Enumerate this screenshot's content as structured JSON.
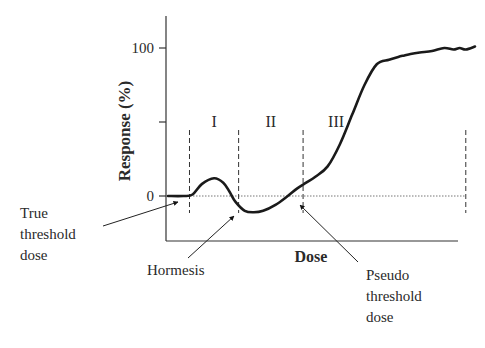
{
  "chart_data": {
    "type": "line",
    "title": "",
    "xlabel": "Dose",
    "ylabel": "Response (%)",
    "yticks": [
      {
        "value": 0,
        "label": "0"
      },
      {
        "value": 50,
        "label": ""
      },
      {
        "value": 100,
        "label": "100"
      }
    ],
    "xlim": [
      0,
      100
    ],
    "ylim": [
      -30,
      120
    ],
    "x": [
      0,
      5,
      8,
      11,
      15,
      18,
      20,
      22,
      25,
      28,
      31,
      35,
      39,
      42,
      45,
      48,
      52,
      56,
      60,
      64,
      68,
      72,
      75,
      77,
      79,
      82,
      86,
      90,
      93,
      95,
      97,
      100
    ],
    "values": [
      0,
      0,
      1,
      8,
      12,
      9,
      3,
      -4,
      -10,
      -11,
      -10,
      -6,
      0,
      5,
      9,
      13,
      20,
      35,
      55,
      75,
      89,
      92,
      94,
      95,
      96,
      97,
      98,
      100,
      99,
      100,
      99,
      101
    ],
    "baseline": {
      "value": 0,
      "style": "dotted"
    },
    "regions": [
      {
        "label": "I",
        "from": 7,
        "to": 23
      },
      {
        "label": "II",
        "from": 23,
        "to": 44
      },
      {
        "label": "III",
        "from": 44,
        "to": 97
      }
    ],
    "boundaries": [
      7,
      23,
      44,
      97
    ],
    "annotations": [
      {
        "text": [
          "True",
          "threshold",
          "dose"
        ],
        "points_to_x": 0
      },
      {
        "text": [
          "Hormesis"
        ],
        "points_to_x": 23
      },
      {
        "text": [
          "Pseudo",
          "threshold",
          "dose"
        ],
        "points_to_x": 44
      }
    ],
    "grid": false,
    "legend": "none"
  }
}
